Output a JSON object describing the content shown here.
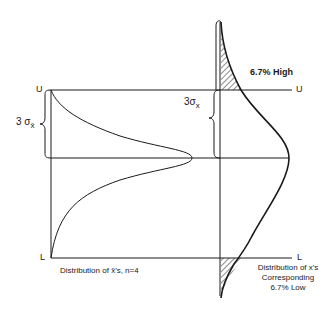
{
  "diagram": {
    "left_panel": {
      "upper_limit_label": "U",
      "lower_limit_label": "L",
      "sigma_label": "3 σ",
      "sigma_subscript": "x̄",
      "caption": "Distribution of  x̄'s, n=4"
    },
    "right_panel": {
      "upper_limit_label": "U",
      "lower_limit_label": "L",
      "sigma_label": "3σ",
      "sigma_subscript": "x",
      "high_tail_label": "6.7% High",
      "caption_lines": [
        "Distribution of  x's",
        "Corresponding",
        "6.7% Low"
      ]
    },
    "colors": {
      "ink": "#1a1a1a",
      "background": "#ffffff"
    }
  }
}
